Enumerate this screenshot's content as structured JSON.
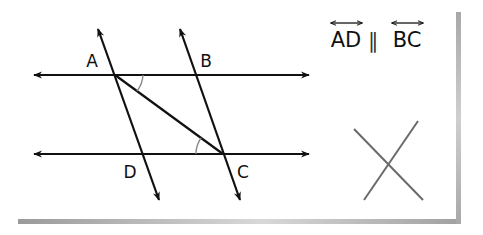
{
  "diagram": {
    "type": "geometry-parallel-lines",
    "card": {
      "background": "#ffffff",
      "shadow_color": "#a8a8a8"
    },
    "lines": {
      "color": "#111111",
      "horizontal_top": {
        "y": 75,
        "x1": 34,
        "x2": 309
      },
      "horizontal_bottom": {
        "y": 154,
        "x1": 34,
        "x2": 309
      },
      "transversal_AD": {
        "x1": 98,
        "y1": 29,
        "x2": 159,
        "y2": 200
      },
      "transversal_BC": {
        "x1": 180,
        "y1": 29,
        "x2": 240,
        "y2": 200
      },
      "segment_AC": {
        "x1": 115,
        "y1": 75,
        "x2": 223,
        "y2": 154
      }
    },
    "points": [
      {
        "label": "A",
        "x": 115,
        "y": 75,
        "label_x": 92,
        "label_y": 67
      },
      {
        "label": "B",
        "x": 196,
        "y": 75,
        "label_x": 206,
        "label_y": 67
      },
      {
        "label": "C",
        "x": 223,
        "y": 154,
        "label_x": 243,
        "label_y": 178
      },
      {
        "label": "D",
        "x": 142,
        "y": 154,
        "label_x": 130,
        "label_y": 178
      }
    ],
    "angle_marks": {
      "color": "#888888",
      "at_A": "angle between AC and top line",
      "at_C": "angle between CA and bottom line"
    },
    "statement": {
      "left": "AD",
      "relation": "∥",
      "right": "BC",
      "notation": "line (double-headed arrow over letters)"
    },
    "verdict": {
      "mark": "X",
      "meaning": "incorrect",
      "color": "#6a6a6a"
    }
  }
}
